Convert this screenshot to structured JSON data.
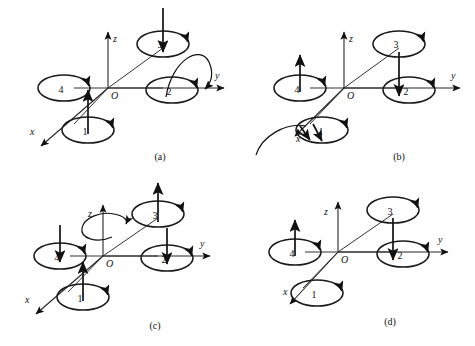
{
  "figure": {
    "background": "#ffffff",
    "ink": "#111111",
    "panels": [
      {
        "id": "a",
        "caption": "(a)",
        "origin_label": "O",
        "axes": [
          {
            "name": "z",
            "label": "z"
          },
          {
            "name": "y",
            "label": "y"
          },
          {
            "name": "x",
            "label": "x"
          }
        ],
        "rotors": [
          {
            "id": "1",
            "label": "1",
            "thrust": "up"
          },
          {
            "id": "2",
            "label": "2",
            "thrust": "none"
          },
          {
            "id": "3",
            "label": "3",
            "thrust": "down"
          },
          {
            "id": "4",
            "label": "4",
            "thrust": "none"
          }
        ],
        "rotation_arc": {
          "about": "y",
          "present": true
        }
      },
      {
        "id": "b",
        "caption": "(b)",
        "origin_label": "O",
        "axes": [
          {
            "name": "z",
            "label": "z"
          },
          {
            "name": "y",
            "label": "y"
          },
          {
            "name": "x",
            "label": "x"
          }
        ],
        "rotors": [
          {
            "id": "1",
            "label": "1",
            "thrust": "none"
          },
          {
            "id": "2",
            "label": "2",
            "thrust": "down"
          },
          {
            "id": "3",
            "label": "3",
            "thrust": "none"
          },
          {
            "id": "4",
            "label": "4",
            "thrust": "up"
          }
        ],
        "rotation_arc": {
          "about": "x",
          "present": true
        }
      },
      {
        "id": "c",
        "caption": "(c)",
        "origin_label": "O",
        "axes": [
          {
            "name": "z",
            "label": "z"
          },
          {
            "name": "y",
            "label": "y"
          },
          {
            "name": "x",
            "label": "x"
          }
        ],
        "rotors": [
          {
            "id": "1",
            "label": "1",
            "thrust": "up"
          },
          {
            "id": "2",
            "label": "2",
            "thrust": "down"
          },
          {
            "id": "3",
            "label": "3",
            "thrust": "up"
          },
          {
            "id": "4",
            "label": "4",
            "thrust": "down"
          }
        ],
        "rotation_arc": {
          "about": "z",
          "present": true
        }
      },
      {
        "id": "d",
        "caption": "(d)",
        "origin_label": "O",
        "axes": [
          {
            "name": "z",
            "label": "z"
          },
          {
            "name": "y",
            "label": "y"
          },
          {
            "name": "x",
            "label": "x"
          }
        ],
        "rotors": [
          {
            "id": "1",
            "label": "1",
            "thrust": "none"
          },
          {
            "id": "2",
            "label": "2",
            "thrust": "down"
          },
          {
            "id": "3",
            "label": "3",
            "thrust": "none"
          },
          {
            "id": "4",
            "label": "4",
            "thrust": "up"
          }
        ],
        "rotation_arc": {
          "about": "none",
          "present": false
        }
      }
    ]
  }
}
